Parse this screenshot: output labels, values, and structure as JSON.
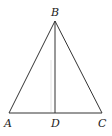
{
  "diagram": {
    "type": "geometry",
    "points": {
      "A": {
        "label": "A",
        "x": 9,
        "y": 113
      },
      "B": {
        "label": "B",
        "x": 55,
        "y": 21
      },
      "C": {
        "label": "C",
        "x": 102,
        "y": 113
      },
      "D": {
        "label": "D",
        "x": 55,
        "y": 113
      }
    },
    "segments": [
      {
        "from": "A",
        "to": "B"
      },
      {
        "from": "B",
        "to": "C"
      },
      {
        "from": "A",
        "to": "C"
      },
      {
        "from": "B",
        "to": "D"
      }
    ],
    "labels": {
      "A": "A",
      "B": "B",
      "C": "C",
      "D": "D"
    },
    "colors": {
      "line": "#333333",
      "text": "#222222",
      "background": "#ffffff"
    }
  }
}
